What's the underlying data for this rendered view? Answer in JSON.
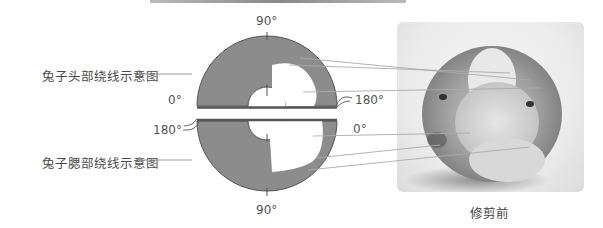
{
  "labels": {
    "head": "兔子头部绕线示意图",
    "belly": "兔子腮部绕线示意图"
  },
  "top_half": {
    "angle_top": "90°",
    "angle_left": "0°",
    "angle_right": "180°"
  },
  "bottom_half": {
    "angle_left": "180°",
    "angle_right": "0°",
    "angle_bottom": "90°"
  },
  "photo": {
    "caption": "修剪前",
    "description": "pompom-rabbit-before-trimming"
  },
  "colors": {
    "ring_fill": "#8c8c8c",
    "ring_stroke": "#555555",
    "leader_line": "#999999",
    "text": "#555555"
  }
}
